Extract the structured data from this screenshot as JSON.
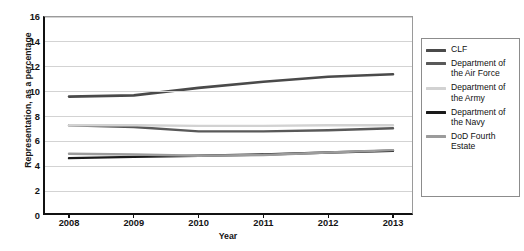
{
  "chart_data": {
    "type": "line",
    "title": "",
    "xlabel": "Year",
    "ylabel": "Representation, as a percentage",
    "categories": [
      "2008",
      "2009",
      "2010",
      "2011",
      "2012",
      "2013"
    ],
    "x": [
      2008,
      2009,
      2010,
      2011,
      2012,
      2013
    ],
    "xlim": [
      2008,
      2013
    ],
    "ylim": [
      0,
      16
    ],
    "yticks": [
      0,
      2,
      4,
      6,
      8,
      10,
      12,
      14,
      16
    ],
    "ytick_labels": [
      "0",
      "2",
      "4",
      "6",
      "8",
      "10",
      "12",
      "14",
      "16"
    ],
    "grid": true,
    "legend_position": "right",
    "series": [
      {
        "name": "CLF",
        "color": "#4a4a4a",
        "width": 2.6,
        "values": [
          9.6,
          9.7,
          10.3,
          10.8,
          11.2,
          11.4
        ]
      },
      {
        "name": "Department of the Air Force",
        "color": "#595959",
        "width": 2.4,
        "values": [
          7.3,
          7.15,
          6.8,
          6.8,
          6.9,
          7.05
        ]
      },
      {
        "name": "Department of the Army",
        "color": "#d2d2d2",
        "width": 2.4,
        "values": [
          7.3,
          7.3,
          7.25,
          7.25,
          7.3,
          7.3
        ]
      },
      {
        "name": "Department of the Navy",
        "color": "#1a1a1a",
        "width": 2.4,
        "values": [
          4.65,
          4.75,
          4.85,
          4.95,
          5.1,
          5.25
        ]
      },
      {
        "name": "DoD Fourth Estate",
        "color": "#9b9b9b",
        "width": 2.4,
        "values": [
          5.0,
          4.95,
          4.85,
          4.9,
          5.1,
          5.3
        ]
      }
    ]
  },
  "legend": {
    "entries": [
      {
        "label": "CLF",
        "color": "#4a4a4a"
      },
      {
        "label": "Department of the Air Force",
        "color": "#595959"
      },
      {
        "label": "Department of the Army",
        "color": "#d2d2d2"
      },
      {
        "label": "Department of the Navy",
        "color": "#1a1a1a"
      },
      {
        "label": "DoD Fourth Estate",
        "color": "#9b9b9b"
      }
    ]
  }
}
